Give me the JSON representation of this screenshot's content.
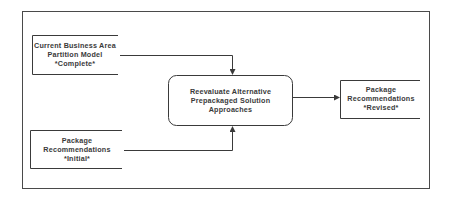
{
  "diagram": {
    "type": "flowchart",
    "nodes": [
      {
        "id": "input1",
        "lines": [
          "Current Business Area",
          "Partition Model",
          "*Complete*"
        ]
      },
      {
        "id": "input2",
        "lines": [
          "Package",
          "Recommendations",
          "*Initial*"
        ]
      },
      {
        "id": "process",
        "lines": [
          "Reevaluate  Alternative",
          "Prepackaged Solution",
          "Approaches"
        ]
      },
      {
        "id": "output",
        "lines": [
          "Package",
          "Recommendations",
          "*Revised*"
        ]
      }
    ],
    "edges": [
      {
        "from": "input1",
        "to": "process"
      },
      {
        "from": "input2",
        "to": "process"
      },
      {
        "from": "process",
        "to": "output"
      }
    ],
    "colors": {
      "line": "#3a3a3a",
      "background": "#ffffff"
    }
  }
}
